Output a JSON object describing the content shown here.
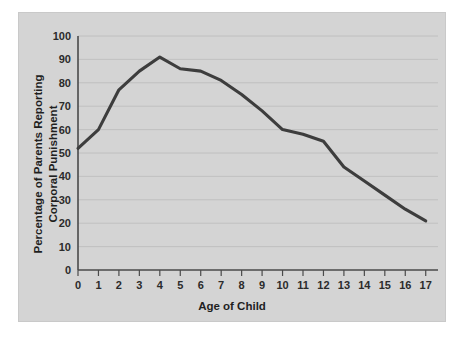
{
  "chart_data": {
    "type": "line",
    "title": "",
    "xlabel": "Age of Child",
    "ylabel": "Percentage of Parents Reporting Corporal Punishment",
    "ylabel_lines": [
      "Percentage of Parents Reporting",
      "Corporal Punishment"
    ],
    "x": [
      0,
      1,
      2,
      3,
      4,
      5,
      6,
      7,
      8,
      9,
      10,
      11,
      12,
      13,
      14,
      15,
      16,
      17
    ],
    "values": [
      52,
      60,
      77,
      85,
      91,
      86,
      85,
      81,
      75,
      68,
      60,
      58,
      55,
      44,
      38,
      32,
      26,
      21
    ],
    "series": [
      {
        "name": "Percentage of Parents Reporting Corporal Punishment",
        "values": [
          52,
          60,
          77,
          85,
          91,
          86,
          85,
          81,
          75,
          68,
          60,
          58,
          55,
          44,
          38,
          32,
          26,
          21
        ]
      }
    ],
    "xlim": [
      0,
      17.6
    ],
    "ylim": [
      0,
      100
    ],
    "x_tick_labels": [
      "0",
      "1",
      "2",
      "3",
      "4",
      "5",
      "6",
      "7",
      "8",
      "9",
      "10",
      "11",
      "12",
      "13",
      "14",
      "15",
      "16",
      "17"
    ],
    "y_tick_labels": [
      "0",
      "10",
      "20",
      "30",
      "40",
      "50",
      "60",
      "70",
      "80",
      "90",
      "100"
    ],
    "y_ticks": [
      0,
      10,
      20,
      30,
      40,
      50,
      60,
      70,
      80,
      90,
      100
    ],
    "grid": "horizontal",
    "legend": "none",
    "colors": {
      "panel_background": "#d4d4d4",
      "figure_background": "#ffffff",
      "line": "#3d3d3d",
      "gridline": "#bdbdbd",
      "axis": "#4a4a4a",
      "text": "#1f1f1f"
    }
  }
}
